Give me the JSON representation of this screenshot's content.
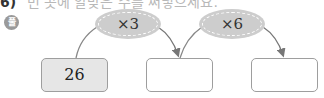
{
  "problem": {
    "header_number": "6)",
    "header_text_partial": "빈 곳에 알맞은 수를 써넣으세요.",
    "solve_badge": "풀"
  },
  "diagram": {
    "operations": [
      {
        "label": "×3"
      },
      {
        "label": "×6"
      }
    ],
    "boxes": [
      {
        "value": "26"
      },
      {
        "value": ""
      },
      {
        "value": ""
      }
    ]
  },
  "colors": {
    "oval_fill": "#cdcdcd",
    "box_border": "#9e9e9e",
    "filled_box": "#e6e6e6",
    "arrow": "#777777"
  }
}
